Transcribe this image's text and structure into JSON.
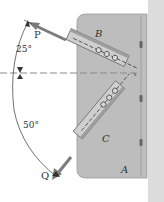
{
  "diagram": {
    "plate_label": "A",
    "members": [
      {
        "label": "B",
        "force_label": "P",
        "angle_label": "25°"
      },
      {
        "label": "C",
        "force_label": "Q",
        "angle_label": "50°"
      }
    ],
    "colors": {
      "plate": "#b9b9b9",
      "plate_edge": "#8f8f8f",
      "wall": "#d9d9d9",
      "member": "#c9c9c9",
      "member_edge": "#6f6f6f",
      "arrow": "#7a7a7a",
      "dash": "#8a8a8a",
      "text": "#333333"
    }
  }
}
